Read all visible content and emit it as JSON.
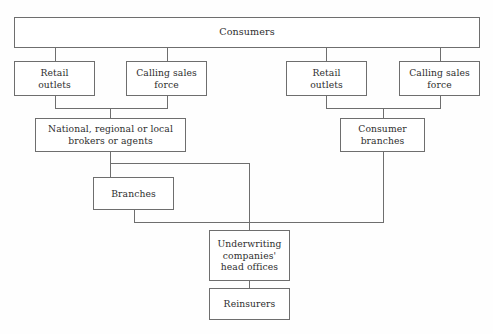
{
  "diagram": {
    "type": "organizational-flow-chart",
    "background_color": "#fefefe",
    "line_color": "#6e6e6e",
    "text_color": "#2e2e2e",
    "nodes": [
      {
        "id": "consumers",
        "label": "Consumers",
        "x": 14,
        "y": 17,
        "w": 466,
        "h": 31,
        "wide": true
      },
      {
        "id": "retail-outlets-left",
        "label": "Retail\noutlets",
        "x": 14,
        "y": 61,
        "w": 81,
        "h": 35,
        "wide": false
      },
      {
        "id": "calling-sales-force-left",
        "label": "Calling sales\nforce",
        "x": 126,
        "y": 61,
        "w": 81,
        "h": 35,
        "wide": false
      },
      {
        "id": "retail-outlets-right",
        "label": "Retail\noutlets",
        "x": 286,
        "y": 61,
        "w": 81,
        "h": 35,
        "wide": false
      },
      {
        "id": "calling-sales-force-right",
        "label": "Calling sales\nforce",
        "x": 399,
        "y": 61,
        "w": 81,
        "h": 35,
        "wide": false
      },
      {
        "id": "brokers-or-agents",
        "label": "National, regional or local\nbrokers or agents",
        "x": 35,
        "y": 118,
        "w": 151,
        "h": 34,
        "wide": false
      },
      {
        "id": "consumer-branches",
        "label": "Consumer\nbranches",
        "x": 340,
        "y": 118,
        "w": 85,
        "h": 34,
        "wide": false
      },
      {
        "id": "branches",
        "label": "Branches",
        "x": 93,
        "y": 177,
        "w": 81,
        "h": 33,
        "wide": false
      },
      {
        "id": "underwriting-head-offices",
        "label": "Underwriting\ncompanies'\nhead offices",
        "x": 209,
        "y": 230,
        "w": 81,
        "h": 51,
        "wide": false
      },
      {
        "id": "reinsurers",
        "label": "Reinsurers",
        "x": 209,
        "y": 288,
        "w": 81,
        "h": 32,
        "wide": false
      }
    ],
    "connectors": [
      {
        "id": "consumers-to-retail-left",
        "points": "55,48 55,61"
      },
      {
        "id": "consumers-to-calling-left",
        "points": "167,48 167,61"
      },
      {
        "id": "consumers-to-retail-right",
        "points": "326,48 326,61"
      },
      {
        "id": "consumers-to-calling-right",
        "points": "440,48 440,61"
      },
      {
        "id": "left-merge-bus",
        "points": "55,96 55,108 167,108 167,96"
      },
      {
        "id": "left-merge-drop-to-brokers",
        "points": "110,108 110,118"
      },
      {
        "id": "right-merge-bus",
        "points": "326,96 326,108 440,108 440,96"
      },
      {
        "id": "right-merge-drop-to-branches",
        "points": "383,108 383,118"
      },
      {
        "id": "brokers-drop",
        "points": "110,152 110,177"
      },
      {
        "id": "brokers-bus-to-underwriting",
        "points": "110,163 249,163 249,230"
      },
      {
        "id": "branches-drop-to-bus",
        "points": "134,210 134,222 383,222"
      },
      {
        "id": "consumer-branches-drop-to-bus",
        "points": "383,152 383,222"
      },
      {
        "id": "underwriting-to-reinsurers",
        "points": "249,281 249,288"
      }
    ]
  }
}
